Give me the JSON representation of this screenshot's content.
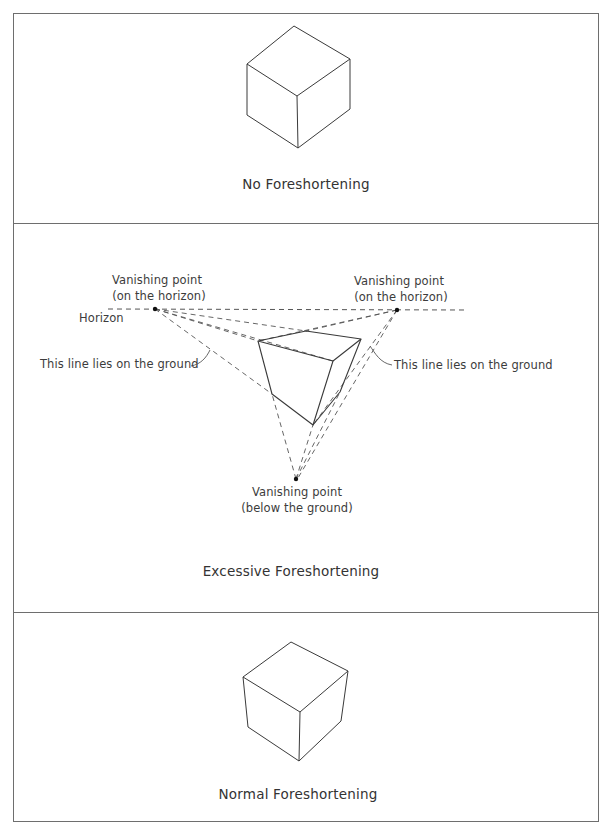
{
  "panels": [
    {
      "id": "no-foreshortening",
      "caption": "No Foreshortening"
    },
    {
      "id": "excessive-foreshortening",
      "caption": "Excessive Foreshortening",
      "labels": {
        "vp_left_line1": "Vanishing point",
        "vp_left_line2": "(on the horizon)",
        "vp_right_line1": "Vanishing point",
        "vp_right_line2": "(on the horizon)",
        "horizon": "Horizon",
        "ground_line_left": "This line lies on the ground",
        "ground_line_right": "This line lies on the ground",
        "vp_bottom_line1": "Vanishing point",
        "vp_bottom_line2": "(below the ground)"
      }
    },
    {
      "id": "normal-foreshortening",
      "caption": "Normal Foreshortening"
    }
  ],
  "colors": {
    "line": "#3a3a3a",
    "frame": "#6e6e6e",
    "dashed": "#555555",
    "background": "#ffffff"
  }
}
